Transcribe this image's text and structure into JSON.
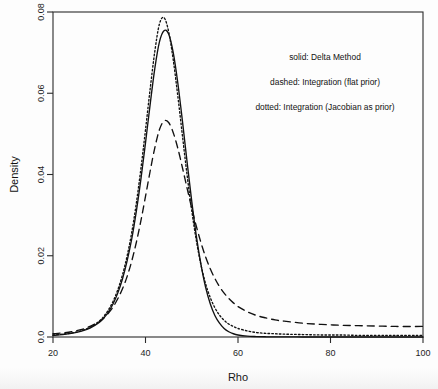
{
  "chart_data": {
    "type": "line",
    "title": "",
    "xlabel": "Rho",
    "ylabel": "Density",
    "xlim": [
      20,
      100
    ],
    "ylim": [
      0.0,
      0.08
    ],
    "grid": false,
    "legend_position": "top-right",
    "xticks": [
      20,
      40,
      60,
      80,
      100
    ],
    "xtick_labels": [
      "20",
      "40",
      "60",
      "80",
      "100"
    ],
    "yticks": [
      0.0,
      0.02,
      0.04,
      0.06,
      0.08
    ],
    "ytick_labels": [
      "0.0",
      "0.02",
      "0.04",
      "0.06",
      "0.08"
    ],
    "annotations": [
      "solid: Delta Method",
      "dashed: Integration (flat prior)",
      "dotted: Integration (Jacobian as prior)"
    ],
    "x": [
      20,
      22,
      24,
      26,
      28,
      30,
      31,
      32,
      33,
      34,
      35,
      36,
      37,
      38,
      39,
      40,
      41,
      42,
      43,
      44,
      45,
      46,
      47,
      48,
      49,
      50,
      51,
      52,
      53,
      54,
      55,
      56,
      57,
      58,
      59,
      60,
      62,
      64,
      66,
      68,
      70,
      74,
      78,
      82,
      86,
      90,
      94,
      100
    ],
    "series": [
      {
        "name": "Delta Method",
        "style": "solid",
        "peak_x": 44.5,
        "peak_y": 0.0755,
        "values": [
          0.0004,
          0.0006,
          0.0009,
          0.0014,
          0.0022,
          0.0036,
          0.0047,
          0.0062,
          0.0082,
          0.0108,
          0.0142,
          0.0186,
          0.024,
          0.0308,
          0.0388,
          0.0478,
          0.0572,
          0.066,
          0.0726,
          0.0754,
          0.0746,
          0.07,
          0.0624,
          0.053,
          0.043,
          0.0334,
          0.0248,
          0.0178,
          0.0122,
          0.0082,
          0.0053,
          0.0034,
          0.0021,
          0.0013,
          0.0008,
          0.0005,
          0.0002,
          0.0001,
          5e-05,
          3e-05,
          2e-05,
          1e-05,
          1e-05,
          0.0,
          0.0,
          0.0,
          0.0,
          0.0
        ]
      },
      {
        "name": "Integration (flat prior)",
        "style": "dashed",
        "peak_x": 44.0,
        "peak_y": 0.0532,
        "values": [
          0.0008,
          0.001,
          0.0013,
          0.0018,
          0.0026,
          0.0038,
          0.0047,
          0.0059,
          0.0074,
          0.0094,
          0.0118,
          0.0148,
          0.0186,
          0.0232,
          0.0286,
          0.0346,
          0.0408,
          0.0465,
          0.051,
          0.0532,
          0.0528,
          0.0503,
          0.0464,
          0.0416,
          0.0366,
          0.0317,
          0.0272,
          0.0232,
          0.0197,
          0.0168,
          0.0144,
          0.0124,
          0.0108,
          0.0095,
          0.0084,
          0.0075,
          0.0062,
          0.0053,
          0.0047,
          0.0042,
          0.0039,
          0.0034,
          0.0031,
          0.0029,
          0.0028,
          0.0027,
          0.0026,
          0.0026
        ]
      },
      {
        "name": "Integration (Jacobian as prior)",
        "style": "dotted",
        "peak_x": 43.5,
        "peak_y": 0.0786,
        "values": [
          0.0005,
          0.0007,
          0.001,
          0.0015,
          0.0024,
          0.0039,
          0.0051,
          0.0067,
          0.0088,
          0.0116,
          0.0152,
          0.0198,
          0.0256,
          0.0328,
          0.0414,
          0.051,
          0.061,
          0.0702,
          0.077,
          0.0786,
          0.0752,
          0.0682,
          0.0592,
          0.0494,
          0.0398,
          0.0311,
          0.0237,
          0.0177,
          0.0131,
          0.0097,
          0.0072,
          0.0054,
          0.0041,
          0.0032,
          0.0026,
          0.0021,
          0.0015,
          0.0011,
          0.0009,
          0.0008,
          0.0007,
          0.0006,
          0.0005,
          0.0005,
          0.0004,
          0.0004,
          0.0004,
          0.0004
        ]
      }
    ]
  }
}
